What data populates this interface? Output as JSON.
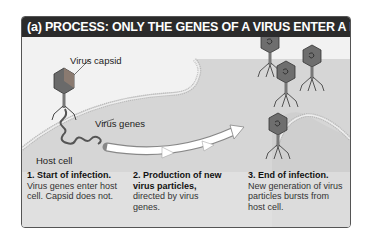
{
  "header": {
    "label": "(a)",
    "title": "PROCESS: ONLY THE GENES OF A VIRUS ENTER A HOST CELL",
    "title_prefix": "PROCESS:",
    "title_rest": "ONLY THE GENES OF A VIRUS ENTER A HOST CELL"
  },
  "labels": {
    "capsid": "Virus capsid",
    "genes": "Virus genes",
    "host": "Host cell"
  },
  "steps": [
    {
      "title": "1. Start of infection.",
      "body": "Virus genes enter host cell. Capsid does not."
    },
    {
      "title": "2. Production of new virus particles,",
      "body": "directed by virus genes."
    },
    {
      "title": "3. End of infection.",
      "body": "New generation of virus particles bursts from host cell."
    }
  ],
  "colors": {
    "header_bg": "#2b2b2b",
    "panel_bg": "#f2f2f2",
    "cell": "#d4d4d4",
    "capsid": "#6a6a6a"
  }
}
